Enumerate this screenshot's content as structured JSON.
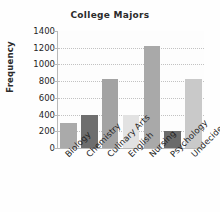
{
  "chart_data": {
    "type": "bar",
    "title": "College Majors",
    "xlabel": "",
    "ylabel": "Frequency",
    "categories": [
      "Biology",
      "Chemistry",
      "Culinary Arts",
      "English",
      "Nursing",
      "Psychology",
      "Undecided"
    ],
    "values": [
      300,
      400,
      820,
      400,
      1220,
      200,
      820
    ],
    "ylim": [
      0,
      1400
    ],
    "ytick_labels": [
      "0",
      "200",
      "400",
      "600",
      "800",
      "1000",
      "1200",
      "1400"
    ],
    "ytick_values": [
      0,
      200,
      400,
      600,
      800,
      1000,
      1200,
      1400
    ],
    "grid": true,
    "grid_axis": "y",
    "legend": false,
    "bar_colors": [
      "#aaaaaa",
      "#6e6e6e",
      "#a3a3a3",
      "#e2e2e2",
      "#a9a9a9",
      "#6b6b6b",
      "#c9c9c9"
    ],
    "background_color": "#fefefe",
    "axis_color": "#b9b9b9",
    "grid_color": "#c2c2c2",
    "text_color": "#1f1f1f"
  }
}
